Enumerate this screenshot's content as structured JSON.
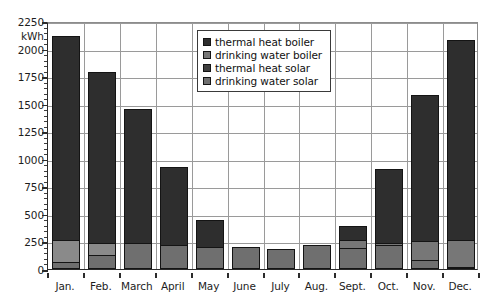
{
  "chart_data": {
    "type": "bar",
    "subtype": "stacked-bar",
    "title": "",
    "xlabel": "",
    "ylabel": "kWh",
    "unit_label": "kWh",
    "ylim": [
      0,
      2250
    ],
    "ytick_step": 250,
    "yticks": [
      0,
      250,
      500,
      750,
      1000,
      1250,
      1500,
      1750,
      2000,
      2250
    ],
    "ytick_labels": [
      "0",
      "250",
      "500",
      "750",
      "1000",
      "1250",
      "1500",
      "1750",
      "2000",
      "2250"
    ],
    "minor_ticks": true,
    "grid": true,
    "grid_axis": "both",
    "legend_position": "upper-center",
    "categories": [
      "Jan.",
      "Feb.",
      "March",
      "April",
      "May",
      "June",
      "July",
      "Aug.",
      "Sept.",
      "Oct.",
      "Nov.",
      "Dec."
    ],
    "series": [
      {
        "name": "drinking water solar",
        "color": "#6f6f6f",
        "stack_order": 1,
        "values": [
          60,
          125,
          240,
          215,
          200,
          200,
          180,
          215,
          190,
          215,
          85,
          20
        ]
      },
      {
        "name": "thermal heat solar",
        "color": "#8a8a8a",
        "stack_order": 2,
        "values": [
          200,
          110,
          0,
          0,
          0,
          0,
          0,
          0,
          0,
          0,
          0,
          0
        ]
      },
      {
        "name": "drinking water boiler",
        "color": "#777777",
        "stack_order": 3,
        "values": [
          0,
          0,
          0,
          0,
          0,
          0,
          0,
          0,
          75,
          25,
          170,
          245
        ]
      },
      {
        "name": "thermal heat boiler",
        "color": "#2e2e2e",
        "stack_order": 4,
        "values": [
          1855,
          1550,
          1215,
          710,
          245,
          0,
          0,
          0,
          125,
          665,
          1320,
          1815
        ]
      }
    ],
    "totals": [
      2115,
      1785,
      1455,
      925,
      445,
      200,
      180,
      215,
      390,
      905,
      1575,
      2080
    ]
  },
  "legend": {
    "items": [
      {
        "label": "thermal heat boiler",
        "color": "#2e2e2e"
      },
      {
        "label": "drinking water boiler",
        "color": "#777777"
      },
      {
        "label": "thermal heat solar",
        "color": "#3f3f3f"
      },
      {
        "label": "drinking water solar",
        "color": "#6f6f6f"
      }
    ]
  },
  "axes": {
    "y_unit": "kWh",
    "y_tick_labels": [
      "2250",
      "2000",
      "1750",
      "1500",
      "1250",
      "1000",
      "750",
      "500",
      "250",
      "0"
    ],
    "x_tick_labels": [
      "Jan.",
      "Feb.",
      "March",
      "April",
      "May",
      "June",
      "July",
      "Aug.",
      "Sept.",
      "Oct.",
      "Nov.",
      "Dec."
    ]
  },
  "colors": {
    "axis": "#2b2b2b",
    "grid": "#9a9a9a",
    "background": "#ffffff",
    "bar_outline": "#141414"
  }
}
